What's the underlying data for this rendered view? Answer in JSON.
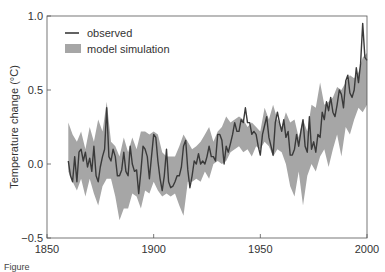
{
  "chart_data": {
    "type": "line",
    "title": "",
    "xlabel": "",
    "ylabel": "Temperature change (°C)",
    "xlim": [
      1850,
      2000
    ],
    "ylim": [
      -0.5,
      1.0
    ],
    "x_ticks": [
      "1850",
      "1900",
      "1950",
      "2000"
    ],
    "y_ticks": [
      "1.0",
      "0.5",
      "0.0",
      "−0.5"
    ],
    "grid": false,
    "legend_position": "upper left",
    "legend": [
      "observed",
      "model simulation"
    ],
    "series": [
      {
        "name": "observed",
        "style": "line",
        "color": "#3a3a3a",
        "x": [
          1860,
          1861,
          1862,
          1863,
          1864,
          1865,
          1866,
          1867,
          1868,
          1869,
          1870,
          1871,
          1872,
          1873,
          1874,
          1875,
          1876,
          1877,
          1878,
          1879,
          1880,
          1881,
          1882,
          1883,
          1884,
          1885,
          1886,
          1887,
          1888,
          1889,
          1890,
          1891,
          1892,
          1893,
          1894,
          1895,
          1896,
          1897,
          1898,
          1899,
          1900,
          1901,
          1902,
          1903,
          1904,
          1905,
          1906,
          1907,
          1908,
          1909,
          1910,
          1911,
          1912,
          1913,
          1914,
          1915,
          1916,
          1917,
          1918,
          1919,
          1920,
          1921,
          1922,
          1923,
          1924,
          1925,
          1926,
          1927,
          1928,
          1929,
          1930,
          1931,
          1932,
          1933,
          1934,
          1935,
          1936,
          1937,
          1938,
          1939,
          1940,
          1941,
          1942,
          1943,
          1944,
          1945,
          1946,
          1947,
          1948,
          1949,
          1950,
          1951,
          1952,
          1953,
          1954,
          1955,
          1956,
          1957,
          1958,
          1959,
          1960,
          1961,
          1962,
          1963,
          1964,
          1965,
          1966,
          1967,
          1968,
          1969,
          1970,
          1971,
          1972,
          1973,
          1974,
          1975,
          1976,
          1977,
          1978,
          1979,
          1980,
          1981,
          1982,
          1983,
          1984,
          1985,
          1986,
          1987,
          1988,
          1989,
          1990,
          1991,
          1992,
          1993,
          1994,
          1995,
          1996,
          1997,
          1998,
          1999,
          2000
        ],
        "values": [
          0.02,
          -0.08,
          -0.12,
          0.05,
          -0.12,
          0.08,
          0.1,
          0.02,
          0.08,
          -0.02,
          0.04,
          -0.05,
          0.12,
          -0.08,
          -0.12,
          -0.02,
          0.05,
          0.1,
          0.38,
          0.05,
          0.02,
          0.1,
          0.05,
          -0.08,
          -0.08,
          -0.04,
          0.08,
          -0.05,
          -0.08,
          0.12,
          0.0,
          -0.05,
          -0.04,
          -0.2,
          -0.05,
          0.12,
          0.1,
          0.05,
          -0.1,
          0.05,
          0.2,
          0.18,
          0.02,
          -0.1,
          -0.18,
          -0.08,
          0.1,
          -0.12,
          -0.16,
          -0.15,
          -0.12,
          -0.08,
          -0.08,
          -0.02,
          0.12,
          0.16,
          -0.04,
          -0.16,
          -0.08,
          0.02,
          0.0,
          0.07,
          0.0,
          0.02,
          0.0,
          0.05,
          0.12,
          0.05,
          0.05,
          0.02,
          0.2,
          0.2,
          0.16,
          0.0,
          0.12,
          0.08,
          0.14,
          0.2,
          0.28,
          0.22,
          0.22,
          0.3,
          0.28,
          0.38,
          0.28,
          0.28,
          0.2,
          0.22,
          0.2,
          0.12,
          0.06,
          0.2,
          0.26,
          0.32,
          0.18,
          0.12,
          0.06,
          0.28,
          0.35,
          0.28,
          0.22,
          0.3,
          0.18,
          0.22,
          0.06,
          0.06,
          0.1,
          0.2,
          0.12,
          0.22,
          0.3,
          0.12,
          0.08,
          0.32,
          0.1,
          0.15,
          0.08,
          0.2,
          0.18,
          0.35,
          0.3,
          0.42,
          0.36,
          0.45,
          0.35,
          0.32,
          0.4,
          0.5,
          0.47,
          0.38,
          0.56,
          0.6,
          0.48,
          0.45,
          0.5,
          0.65,
          0.55,
          0.68,
          0.95,
          0.72,
          0.7
        ]
      },
      {
        "name": "model simulation",
        "style": "band",
        "color": "#a6a6a6",
        "x": [
          1860,
          1862,
          1864,
          1866,
          1868,
          1870,
          1872,
          1874,
          1876,
          1878,
          1880,
          1882,
          1884,
          1886,
          1888,
          1890,
          1892,
          1894,
          1896,
          1898,
          1900,
          1902,
          1904,
          1906,
          1908,
          1910,
          1912,
          1914,
          1916,
          1918,
          1920,
          1922,
          1924,
          1926,
          1928,
          1930,
          1932,
          1934,
          1936,
          1938,
          1940,
          1942,
          1944,
          1946,
          1948,
          1950,
          1952,
          1954,
          1956,
          1958,
          1960,
          1962,
          1964,
          1966,
          1968,
          1970,
          1972,
          1974,
          1976,
          1978,
          1980,
          1982,
          1984,
          1986,
          1988,
          1990,
          1992,
          1994,
          1996,
          1998,
          2000
        ],
        "lower": [
          -0.05,
          -0.12,
          -0.18,
          -0.1,
          -0.22,
          -0.1,
          -0.2,
          -0.28,
          -0.15,
          -0.1,
          -0.1,
          -0.22,
          -0.38,
          -0.3,
          -0.3,
          -0.2,
          -0.22,
          -0.3,
          -0.18,
          -0.2,
          -0.12,
          -0.18,
          -0.22,
          -0.2,
          -0.22,
          -0.2,
          -0.28,
          -0.35,
          -0.12,
          -0.12,
          -0.1,
          -0.12,
          -0.05,
          -0.1,
          0.0,
          0.02,
          0.0,
          0.02,
          0.08,
          0.1,
          0.12,
          0.08,
          0.1,
          0.05,
          0.12,
          0.1,
          0.15,
          0.12,
          0.05,
          0.1,
          0.08,
          0.0,
          -0.15,
          -0.22,
          -0.05,
          -0.28,
          -0.08,
          0.0,
          -0.05,
          0.05,
          0.1,
          -0.02,
          0.1,
          0.2,
          0.05,
          0.25,
          0.2,
          0.3,
          0.38,
          0.35,
          0.4
        ],
        "upper": [
          0.28,
          0.2,
          0.15,
          0.22,
          0.1,
          0.25,
          0.15,
          0.3,
          0.22,
          0.42,
          0.15,
          0.12,
          0.05,
          0.18,
          0.08,
          0.18,
          0.1,
          0.22,
          0.22,
          0.2,
          0.22,
          0.2,
          0.08,
          0.05,
          0.05,
          0.05,
          0.12,
          0.2,
          0.15,
          0.1,
          0.12,
          0.15,
          0.2,
          0.25,
          0.15,
          0.22,
          0.25,
          0.32,
          0.28,
          0.3,
          0.32,
          0.3,
          0.25,
          0.28,
          0.25,
          0.22,
          0.38,
          0.3,
          0.4,
          0.3,
          0.25,
          0.35,
          0.28,
          0.3,
          0.18,
          0.3,
          0.22,
          0.4,
          0.38,
          0.55,
          0.4,
          0.42,
          0.45,
          0.52,
          0.5,
          0.55,
          0.6,
          0.58,
          0.62,
          0.72,
          0.75
        ]
      }
    ]
  },
  "caption": {
    "text": "Figure"
  }
}
